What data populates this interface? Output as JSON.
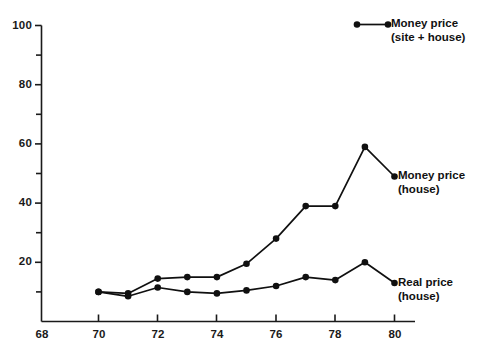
{
  "chart_data": {
    "type": "line",
    "title": "",
    "subtitle": "",
    "xlabel": "",
    "ylabel": "",
    "xlim": [
      68,
      81
    ],
    "ylim": [
      0,
      100
    ],
    "x_ticks": [
      68,
      70,
      72,
      74,
      76,
      78,
      80
    ],
    "x_tick_labels": [
      "68",
      "70",
      "72",
      "74",
      "76",
      "78",
      "80"
    ],
    "x_minor_ticks": [
      69,
      71,
      73,
      75,
      77,
      79
    ],
    "y_ticks": [
      0,
      20,
      40,
      60,
      80,
      100
    ],
    "y_tick_labels": [
      "0",
      "20",
      "40",
      "60",
      "80",
      "100"
    ],
    "y_minor_ticks": [
      10,
      30,
      50,
      70,
      90
    ],
    "y_tick_labels_shown": [
      "20",
      "40",
      "60",
      "80",
      "100"
    ],
    "grid": false,
    "legend_position": "top-right",
    "marker": "filled-circle",
    "line_color": "#101010",
    "marker_color": "#101010",
    "background_color": "#ffffff",
    "x": [
      70,
      71,
      72,
      73,
      74,
      75,
      76,
      77,
      78,
      79,
      80
    ],
    "series": [
      {
        "name": "Money price (house)",
        "label_line1": "Money price",
        "label_line2": "(house)",
        "values": [
          10,
          9.5,
          14.5,
          15,
          15,
          19.5,
          28,
          39,
          39,
          59,
          49
        ]
      },
      {
        "name": "Real price (house)",
        "label_line1": "Real price",
        "label_line2": "(house)",
        "values": [
          10,
          8.5,
          11.5,
          10,
          9.5,
          10.5,
          12,
          15,
          14,
          20,
          13
        ]
      }
    ],
    "legend_entries": [
      {
        "name": "Money price (site + house)",
        "label_line1": "Money price",
        "label_line2": "(site + house)"
      }
    ]
  },
  "annotations": {
    "money_price_house": {
      "line1": "Money price",
      "line2": "(house)"
    },
    "real_price_house": {
      "line1": "Real price",
      "line2": "(house)"
    }
  },
  "legend": {
    "money_price_site_house": {
      "line1": "Money price",
      "line2": "(site + house)"
    }
  },
  "axes": {
    "y_labels": [
      "100",
      "80",
      "60",
      "40",
      "20"
    ],
    "x_labels": [
      "68",
      "70",
      "72",
      "74",
      "76",
      "78",
      "80"
    ]
  }
}
